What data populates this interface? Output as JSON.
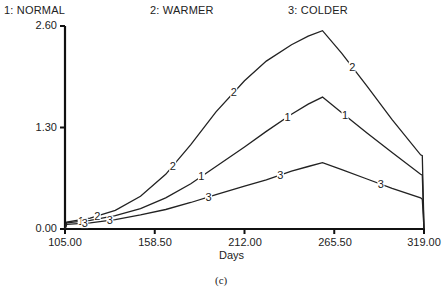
{
  "legend": {
    "s1": "1: NORMAL",
    "s2": "2:  WARMER",
    "s3": "3:  COLDER"
  },
  "axes": {
    "y_ticks": [
      "2.60",
      "1.30",
      "0.00"
    ],
    "x_ticks": [
      "105.00",
      "158.50",
      "212.00",
      "265.50",
      "319.00"
    ],
    "xlabel": "Days"
  },
  "caption": "(c)",
  "chart_data": {
    "type": "line",
    "title": "",
    "xlabel": "Days",
    "ylabel": "",
    "xlim": [
      105,
      319
    ],
    "ylim": [
      0,
      2.6
    ],
    "x_ticks": [
      105,
      158.5,
      212,
      265.5,
      319
    ],
    "y_ticks": [
      0,
      1.3,
      2.6
    ],
    "grid": false,
    "legend_position": "top",
    "x": [
      105,
      106,
      120,
      135,
      150,
      165,
      180,
      195,
      212,
      225,
      240,
      250,
      258.5,
      270,
      285,
      300,
      317,
      318,
      319
    ],
    "series": [
      {
        "name": "1: NORMAL",
        "values": [
          0.0,
          0.08,
          0.11,
          0.17,
          0.26,
          0.4,
          0.58,
          0.8,
          1.05,
          1.25,
          1.47,
          1.6,
          1.69,
          1.49,
          1.23,
          0.98,
          0.7,
          0.69,
          0.0
        ]
      },
      {
        "name": "2: WARMER",
        "values": [
          0.0,
          0.09,
          0.14,
          0.24,
          0.42,
          0.7,
          1.08,
          1.5,
          1.9,
          2.15,
          2.36,
          2.47,
          2.54,
          2.25,
          1.83,
          1.4,
          0.95,
          0.94,
          0.0
        ]
      },
      {
        "name": "3: COLDER",
        "values": [
          0.0,
          0.06,
          0.08,
          0.12,
          0.18,
          0.25,
          0.34,
          0.44,
          0.55,
          0.63,
          0.74,
          0.8,
          0.85,
          0.76,
          0.64,
          0.52,
          0.4,
          0.38,
          0.0
        ]
      }
    ]
  }
}
